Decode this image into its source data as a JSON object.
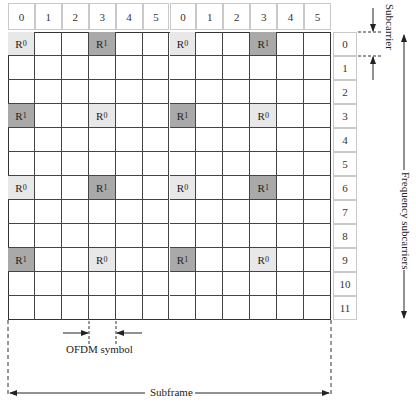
{
  "diagram": {
    "type": "LTE resource grid with reference signals",
    "column_headers": [
      "0",
      "1",
      "2",
      "3",
      "4",
      "5",
      "0",
      "1",
      "2",
      "3",
      "4",
      "5"
    ],
    "row_indices": [
      "0",
      "1",
      "2",
      "3",
      "4",
      "5",
      "6",
      "7",
      "8",
      "9",
      "10",
      "11"
    ],
    "reference_cells": [
      {
        "row": 0,
        "col": 0,
        "label": "R",
        "sub": "0",
        "kind": "r0"
      },
      {
        "row": 0,
        "col": 3,
        "label": "R",
        "sub": "1",
        "kind": "r1"
      },
      {
        "row": 0,
        "col": 6,
        "label": "R",
        "sub": "0",
        "kind": "r0"
      },
      {
        "row": 0,
        "col": 9,
        "label": "R",
        "sub": "1",
        "kind": "r1"
      },
      {
        "row": 3,
        "col": 0,
        "label": "R",
        "sub": "1",
        "kind": "r1"
      },
      {
        "row": 3,
        "col": 3,
        "label": "R",
        "sub": "0",
        "kind": "r0"
      },
      {
        "row": 3,
        "col": 6,
        "label": "R",
        "sub": "1",
        "kind": "r1"
      },
      {
        "row": 3,
        "col": 9,
        "label": "R",
        "sub": "0",
        "kind": "r0"
      },
      {
        "row": 6,
        "col": 0,
        "label": "R",
        "sub": "0",
        "kind": "r0"
      },
      {
        "row": 6,
        "col": 3,
        "label": "R",
        "sub": "1",
        "kind": "r1"
      },
      {
        "row": 6,
        "col": 6,
        "label": "R",
        "sub": "0",
        "kind": "r0"
      },
      {
        "row": 6,
        "col": 9,
        "label": "R",
        "sub": "1",
        "kind": "r1"
      },
      {
        "row": 9,
        "col": 0,
        "label": "R",
        "sub": "1",
        "kind": "r1"
      },
      {
        "row": 9,
        "col": 3,
        "label": "R",
        "sub": "0",
        "kind": "r0"
      },
      {
        "row": 9,
        "col": 6,
        "label": "R",
        "sub": "1",
        "kind": "r1"
      },
      {
        "row": 9,
        "col": 9,
        "label": "R",
        "sub": "0",
        "kind": "r0"
      }
    ],
    "labels": {
      "ofdm_symbol": "OFDM symbol",
      "subframe": "Subframe",
      "subcarrier": "Subcarrier",
      "frequency_subcarriers": "Frequency subcarriers"
    },
    "colors": {
      "r0_fill": "#e8e8e8",
      "r1_fill": "#a9a9a9",
      "grid_line": "#444444"
    }
  }
}
